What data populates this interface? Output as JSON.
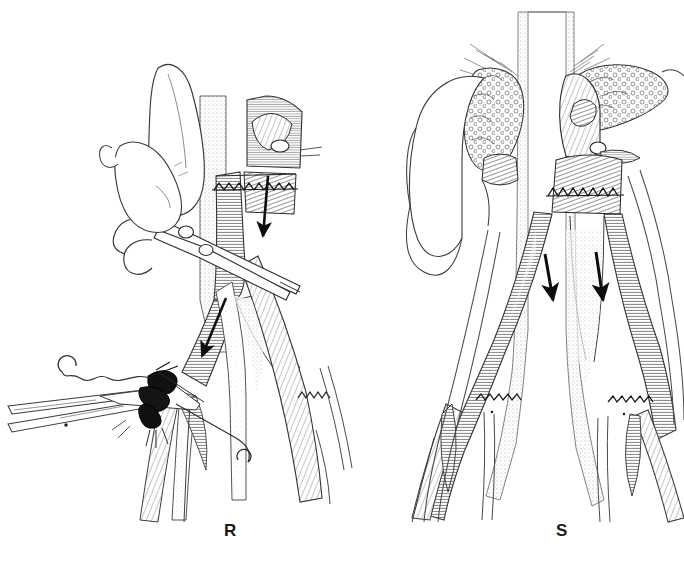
{
  "figure": {
    "kind": "surgical-line-illustration",
    "background_color": "#ffffff",
    "ink_color": "#1a1a1a",
    "shade_color": "#d9d9d9",
    "width": 684,
    "height": 572
  },
  "panels": [
    {
      "id": "R",
      "label": "R",
      "label_x": 224,
      "label_y": 521,
      "description": "Surgeon's gloved hand holding scissors dividing the graft; hemostat and continuous suture with curved needle at distal anastomosis; single arrow indicates flow direction",
      "arrows": [
        {
          "name": "flow-arrow-upper",
          "x1": 268,
          "y1": 175,
          "x2": 264,
          "y2": 238
        },
        {
          "name": "flow-arrow-lower",
          "x1": 225,
          "y1": 300,
          "x2": 200,
          "y2": 360
        }
      ],
      "instruments": [
        {
          "name": "scissors",
          "label": "scissors"
        },
        {
          "name": "hemostat-clamp",
          "label": "clamp"
        },
        {
          "name": "suture-needle",
          "label": "needle"
        },
        {
          "name": "suture-thread",
          "label": "suture"
        },
        {
          "name": "surgeon-hand",
          "label": "hand"
        }
      ]
    },
    {
      "id": "S",
      "label": "S",
      "label_x": 556,
      "label_y": 521,
      "description": "Completed repair: transplanted kidney with perirenal fat in situ beside the aorta; graft limbs anastomosed to both iliac arteries; two arrows show restored bilateral flow",
      "arrows": [
        {
          "name": "flow-arrow-left",
          "x1": 545,
          "y1": 258,
          "x2": 553,
          "y2": 300
        },
        {
          "name": "flow-arrow-right",
          "x1": 595,
          "y1": 256,
          "x2": 601,
          "y2": 300
        }
      ],
      "anatomy": [
        {
          "name": "kidney",
          "label": "kidney"
        },
        {
          "name": "perirenal-fat-left",
          "label": "fat"
        },
        {
          "name": "perirenal-fat-right",
          "label": "fat"
        },
        {
          "name": "aorta",
          "label": "aorta"
        },
        {
          "name": "graft-body",
          "label": "graft"
        },
        {
          "name": "iliac-artery-left",
          "label": "iliac"
        },
        {
          "name": "iliac-artery-right",
          "label": "iliac"
        }
      ]
    }
  ]
}
